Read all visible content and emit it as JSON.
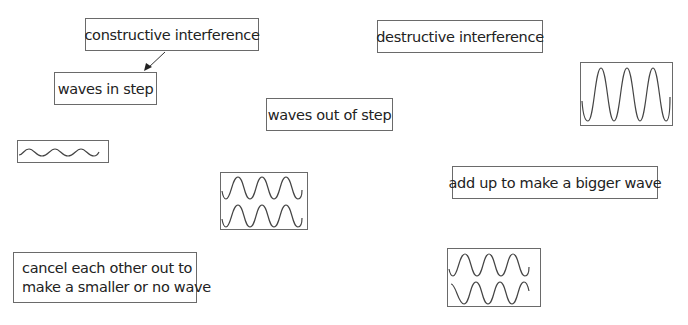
{
  "labels": {
    "constructive": "constructive interference",
    "destructive": "destructive interference",
    "in_step": "waves in step",
    "out_of_step": "waves out of step",
    "bigger_wave": "add up to make a bigger wave",
    "cancel_line1": "cancel each other out to",
    "cancel_line2": "make a smaller or no wave"
  },
  "wave_diagrams": [
    {
      "id": "small-amplitude-wave",
      "description": "single low-amplitude wave",
      "cycles": 3
    },
    {
      "id": "large-amplitude-wave",
      "description": "single high-amplitude wave",
      "cycles": 3
    },
    {
      "id": "in-phase-waves",
      "description": "two waves in step",
      "cycles": 3
    },
    {
      "id": "out-of-phase-waves",
      "description": "two waves out of step",
      "cycles": 3
    }
  ],
  "arrows": [
    {
      "from": "constructive",
      "to": "in_step"
    }
  ],
  "colors": {
    "line": "#444444",
    "border": "#6a6a6a",
    "text": "#222222"
  }
}
